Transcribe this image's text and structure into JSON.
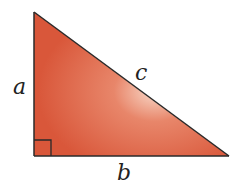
{
  "diagram": {
    "shape": "right-triangle",
    "right_angle_vertex": "bottom-left",
    "labels": {
      "vertical_leg": "a",
      "horizontal_leg": "b",
      "hypotenuse": "c"
    },
    "colors": {
      "fill": "#d9573a",
      "fill_highlight": "#f8d8c8",
      "stroke": "#2a2a2a",
      "label": "#222222"
    }
  }
}
